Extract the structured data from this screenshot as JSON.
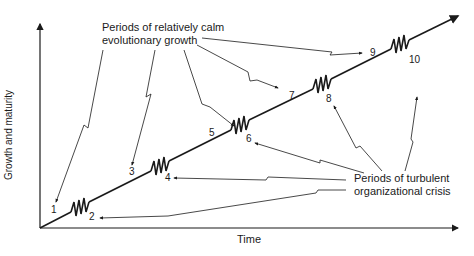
{
  "diagram": {
    "type": "organizational growth phases (Greiner model)",
    "axes": {
      "x_label": "Time",
      "y_label": "Growth and maturity"
    },
    "annotations": {
      "calm": {
        "line1": "Periods of relatively calm",
        "line2": "evolutionary growth"
      },
      "crisis": {
        "line1": "Periods of turbulent",
        "line2": "organizational crisis"
      }
    },
    "phase_labels": [
      "1",
      "2",
      "3",
      "4",
      "5",
      "6",
      "7",
      "8",
      "9",
      "10"
    ],
    "evolutionary_phases": [
      "1",
      "3",
      "5",
      "7",
      "9"
    ],
    "revolutionary_phases": [
      "2",
      "4",
      "6",
      "8",
      "10"
    ],
    "colors": {
      "line": "#1a1a1a",
      "background": "#ffffff"
    }
  }
}
